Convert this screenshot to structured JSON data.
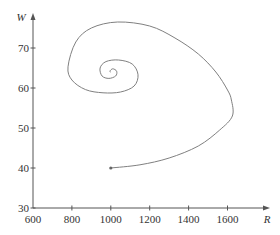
{
  "chart_data": {
    "type": "line",
    "title": "",
    "xlabel": "R",
    "ylabel": "W",
    "xlim": [
      600,
      1700
    ],
    "ylim": [
      30,
      80
    ],
    "x_ticks": [
      600,
      800,
      1000,
      1200,
      1400,
      1600
    ],
    "y_ticks": [
      30,
      40,
      50,
      60,
      70
    ],
    "grid": false,
    "legend": null,
    "series": [
      {
        "name": "trajectory",
        "description": "Spiral trajectory in the R–W phase plane starting at (1000, 40) and spiralling inward toward an equilibrium near (1000, 64)",
        "start_point": [
          1000,
          40
        ],
        "points": [
          [
            1000,
            40
          ],
          [
            1150,
            40.8
          ],
          [
            1300,
            42.5
          ],
          [
            1450,
            45.5
          ],
          [
            1560,
            49.5
          ],
          [
            1625,
            53
          ],
          [
            1620,
            57
          ],
          [
            1600,
            59.5
          ],
          [
            1540,
            64
          ],
          [
            1450,
            68.5
          ],
          [
            1330,
            72.5
          ],
          [
            1200,
            75.5
          ],
          [
            1035,
            76.5
          ],
          [
            900,
            75
          ],
          [
            820,
            71.5
          ],
          [
            780,
            65.3
          ],
          [
            800,
            62
          ],
          [
            870,
            59.6
          ],
          [
            960,
            58.8
          ],
          [
            1050,
            59
          ],
          [
            1120,
            60.5
          ],
          [
            1140,
            63.3
          ],
          [
            1110,
            66
          ],
          [
            1040,
            67
          ],
          [
            975,
            66.6
          ],
          [
            945,
            65
          ],
          [
            955,
            63
          ],
          [
            990,
            62.4
          ],
          [
            1025,
            63
          ],
          [
            1030,
            64.2
          ],
          [
            1010,
            64.8
          ],
          [
            995,
            64.2
          ],
          [
            1000,
            64
          ]
        ]
      }
    ]
  },
  "axes": {
    "x_label": "R",
    "y_label": "W",
    "x_tick_labels": [
      "600",
      "800",
      "1000",
      "1200",
      "1400",
      "1600"
    ],
    "y_tick_labels": [
      "30",
      "40",
      "50",
      "60",
      "70"
    ]
  },
  "colors": {
    "axis": "#555555",
    "curve": "#808080",
    "text": "#333333"
  }
}
